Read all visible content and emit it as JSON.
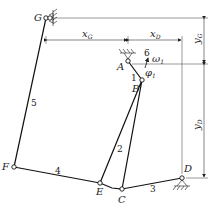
{
  "diagram": {
    "points": {
      "G": {
        "label": "G",
        "x": 46,
        "y": 18
      },
      "A": {
        "label": "A",
        "x": 128,
        "y": 61
      },
      "B": {
        "label": "B",
        "x": 142,
        "y": 80
      },
      "C": {
        "label": "C",
        "x": 122,
        "y": 189
      },
      "D": {
        "label": "D",
        "x": 182,
        "y": 178
      },
      "E": {
        "label": "E",
        "x": 100,
        "y": 183
      },
      "F": {
        "label": "F",
        "x": 14,
        "y": 167
      }
    },
    "links": [
      {
        "id": "1",
        "label": "1",
        "from": "A",
        "to": "B"
      },
      {
        "id": "2",
        "label": "2",
        "from": "B",
        "to": "E/C"
      },
      {
        "id": "3",
        "label": "3",
        "from": "C",
        "to": "D"
      },
      {
        "id": "4",
        "label": "4",
        "from": "F",
        "to": "E"
      },
      {
        "id": "5",
        "label": "5",
        "from": "G",
        "to": "F"
      },
      {
        "id": "6",
        "label": "6",
        "note": "frame/ground"
      }
    ],
    "annotations": {
      "omega": "ω",
      "omega_sub": "1",
      "phi": "φ",
      "phi_sub": "1"
    },
    "dimensions": {
      "xG": {
        "main": "x",
        "sub": "G"
      },
      "xD": {
        "main": "x",
        "sub": "D"
      },
      "yG": {
        "main": "y",
        "sub": "G"
      },
      "yD": {
        "main": "y",
        "sub": "D"
      }
    }
  }
}
